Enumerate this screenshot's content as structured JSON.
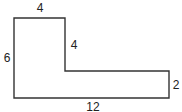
{
  "diagram": {
    "type": "l-shaped-polygon",
    "stroke_color": "#333333",
    "fill_color": "#ffffff",
    "labels": {
      "top_width": "4",
      "inner_vertical": "4",
      "left_height": "6",
      "right_height": "2",
      "bottom_width": "12"
    }
  }
}
